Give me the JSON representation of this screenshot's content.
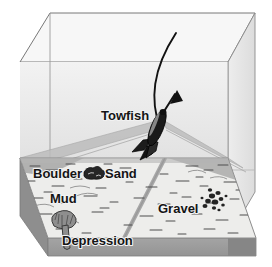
{
  "diagram": {
    "labels": {
      "towfish": "Towfish",
      "boulder": "Boulder",
      "sand": "Sand",
      "mud": "Mud",
      "gravel": "Gravel",
      "depression": "Depression"
    },
    "icons": {
      "towfish": "towfish-icon",
      "boulder": "boulder-rock-icon",
      "gravel": "gravel-cluster-icon",
      "depression": "depression-scour-icon",
      "tow_cable": "tow-cable-line",
      "direction_arrow": "direction-arrow-icon",
      "sonar_beam": "sonar-beam-fan",
      "nadir_track": "nadir-track-line"
    },
    "colors": {
      "background": "#ffffff",
      "water_front": "#ebebeb",
      "water_left": "#e2e2e2",
      "water_top": "#f4f4f4",
      "seafloor_top": "#e6e6e4",
      "seafloor_front": "#9a9a9a",
      "seafloor_side": "#8e8e8e",
      "beam": "#b9b9b9",
      "outline": "#6d6d6d",
      "ink": "#151515"
    }
  }
}
